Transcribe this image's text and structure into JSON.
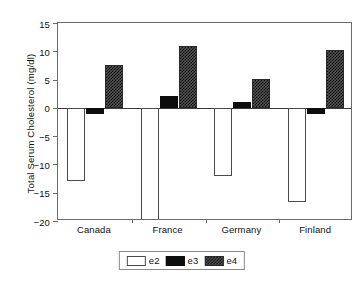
{
  "chart_data": {
    "type": "bar",
    "title": "",
    "subtitle": "",
    "xlabel": "",
    "ylabel": "Total Serum Cholesterol (mg/dl)",
    "categories": [
      "Canada",
      "France",
      "Germany",
      "Finland"
    ],
    "series": [
      {
        "name": "e2",
        "values": [
          -13.0,
          -22.5,
          -12.0,
          -16.7
        ],
        "clipped": [
          false,
          true,
          false,
          false
        ]
      },
      {
        "name": "e3",
        "values": [
          -1.0,
          2.1,
          1.1,
          -1.0
        ],
        "clipped": [
          false,
          false,
          false,
          false
        ]
      },
      {
        "name": "e4",
        "values": [
          7.5,
          11.0,
          5.1,
          10.2
        ],
        "clipped": [
          false,
          false,
          false,
          false
        ]
      }
    ],
    "ylim": [
      -20,
      15
    ],
    "yticks": [
      15,
      10,
      5,
      0,
      -5,
      -10,
      -15,
      -20
    ],
    "ytick_labels": [
      "15",
      "10",
      "5",
      "0",
      "−5",
      "−10",
      "−15",
      "−20"
    ],
    "grid": false,
    "zero_line": true,
    "legend": {
      "position": "bottom-center",
      "orientation": "horizontal",
      "entries": [
        {
          "label": "e2",
          "swatch": "white-open"
        },
        {
          "label": "e3",
          "swatch": "solid-black"
        },
        {
          "label": "e4",
          "swatch": "checker-hatch"
        }
      ]
    },
    "colors": {
      "e2_fill": "#ffffff",
      "e2_edge": "#4a4a4a",
      "e3_fill": "#0d0d0d",
      "e4_fill": "#4f4f4f",
      "e4_hatch": "#111111",
      "axis": "#6b6b6b",
      "zero_line": "#3a3a3a",
      "text": "#111111"
    }
  }
}
